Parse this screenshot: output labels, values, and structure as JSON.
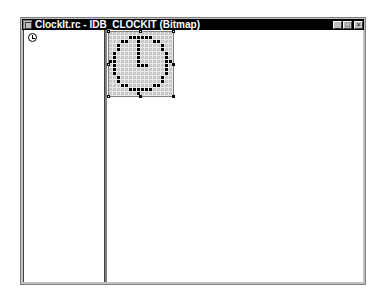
{
  "window": {
    "title": "ClockIt.rc - IDB_CLOCKIT (Bitmap)",
    "buttons": {
      "minimize": "_",
      "maximize": "□",
      "close": "×"
    }
  },
  "left_pane": {
    "thumbnail": "clock-icon"
  },
  "bitmap_editor": {
    "resource_id": "IDB_CLOCKIT",
    "size": [
      16,
      16
    ],
    "pixels": [
      "0000000000000000",
      "0000011111100000",
      "0001100100011000",
      "0010000100000100",
      "0010000100000100",
      "0100000100000010",
      "0100000100000010",
      "1100000100000011",
      "0100000111000010",
      "0100000000000010",
      "0100000000000010",
      "0010000000000100",
      "0010000000000100",
      "0001100000011000",
      "0000011111100000",
      "0000000100000000"
    ],
    "colors": {
      "on": "#000000",
      "off": "#c8c8c8"
    }
  }
}
